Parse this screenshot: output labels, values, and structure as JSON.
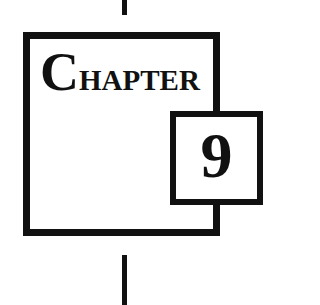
{
  "chapter": {
    "initial": "C",
    "rest": "HAPTER",
    "number": "9"
  },
  "colors": {
    "ink": "#111111",
    "background": "#ffffff"
  }
}
